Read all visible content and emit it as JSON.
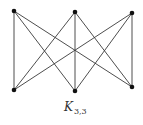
{
  "diagram": {
    "caption": {
      "main": "K",
      "subscript": "3,3"
    },
    "colors": {
      "edge": "#3a3a3a",
      "vertex": "#111111",
      "background": "#ffffff"
    },
    "vertices": [
      {
        "id": "u1",
        "x": 14,
        "y": 11,
        "part": "top"
      },
      {
        "id": "u2",
        "x": 75,
        "y": 12,
        "part": "top"
      },
      {
        "id": "u3",
        "x": 132,
        "y": 13,
        "part": "top"
      },
      {
        "id": "v1",
        "x": 14,
        "y": 90,
        "part": "bottom"
      },
      {
        "id": "v2",
        "x": 75,
        "y": 91,
        "part": "bottom"
      },
      {
        "id": "v3",
        "x": 132,
        "y": 87,
        "part": "bottom"
      }
    ],
    "edges": [
      [
        "u1",
        "v1"
      ],
      [
        "u1",
        "v2"
      ],
      [
        "u1",
        "v3"
      ],
      [
        "u2",
        "v1"
      ],
      [
        "u2",
        "v2"
      ],
      [
        "u2",
        "v3"
      ],
      [
        "u3",
        "v1"
      ],
      [
        "u3",
        "v2"
      ],
      [
        "u3",
        "v3"
      ]
    ]
  }
}
